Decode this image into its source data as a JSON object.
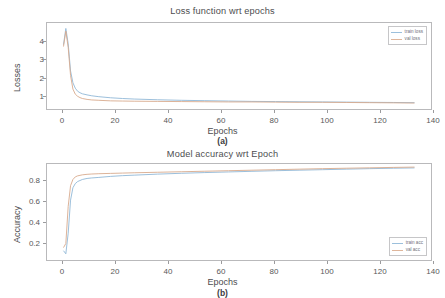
{
  "figure": {
    "panels": [
      {
        "id": "a",
        "subcaption": "(a)",
        "title": "Loss function wrt epochs",
        "xlabel": "Epochs",
        "ylabel": "Losses",
        "xticks": [
          "0",
          "20",
          "40",
          "60",
          "80",
          "100",
          "120",
          "140"
        ],
        "yticks": [
          "1",
          "2",
          "3",
          "4"
        ],
        "legend": [
          {
            "label": "train loss",
            "color": "#8fb7d6"
          },
          {
            "label": "val loss",
            "color": "#d7a98c"
          }
        ]
      },
      {
        "id": "b",
        "subcaption": "(b)",
        "title": "Model accuracy wrt Epoch",
        "xlabel": "Epochs",
        "ylabel": "Accuracy",
        "xticks": [
          "0",
          "20",
          "40",
          "60",
          "80",
          "100",
          "120",
          "140"
        ],
        "yticks": [
          "0.2",
          "0.4",
          "0.6",
          "0.8"
        ],
        "legend": [
          {
            "label": "train acc",
            "color": "#8fb7d6"
          },
          {
            "label": "val acc",
            "color": "#d7a98c"
          }
        ]
      }
    ]
  },
  "chart_data": [
    {
      "type": "line",
      "title": "Loss function wrt epochs",
      "xlabel": "Epochs",
      "ylabel": "Losses",
      "xlim": [
        -7,
        156
      ],
      "ylim": [
        0.0,
        4.75
      ],
      "xticks": [
        0,
        20,
        40,
        60,
        80,
        100,
        120,
        140
      ],
      "yticks": [
        1,
        2,
        3,
        4
      ],
      "grid": false,
      "legend_position": "upper right",
      "x": [
        0,
        1,
        2,
        3,
        4,
        5,
        6,
        7,
        8,
        10,
        12,
        15,
        20,
        25,
        30,
        40,
        50,
        60,
        70,
        80,
        90,
        100,
        110,
        120,
        130,
        140,
        149
      ],
      "series": [
        {
          "name": "train loss",
          "color": "#8fb7d6",
          "values": [
            3.55,
            4.45,
            3.6,
            2.1,
            1.45,
            1.15,
            0.98,
            0.9,
            0.84,
            0.78,
            0.73,
            0.68,
            0.62,
            0.58,
            0.55,
            0.51,
            0.48,
            0.46,
            0.44,
            0.42,
            0.41,
            0.4,
            0.39,
            0.38,
            0.37,
            0.36,
            0.35
          ]
        },
        {
          "name": "val loss",
          "color": "#d7a98c",
          "values": [
            3.45,
            4.3,
            3.4,
            1.85,
            1.1,
            0.82,
            0.7,
            0.63,
            0.58,
            0.53,
            0.5,
            0.48,
            0.45,
            0.44,
            0.43,
            0.42,
            0.41,
            0.4,
            0.39,
            0.39,
            0.38,
            0.37,
            0.37,
            0.36,
            0.35,
            0.34,
            0.33
          ]
        }
      ]
    },
    {
      "type": "line",
      "title": "Model accuracy wrt Epoch",
      "xlabel": "Epochs",
      "ylabel": "Accuracy",
      "xlim": [
        -7,
        156
      ],
      "ylim": [
        0.04,
        0.97
      ],
      "xticks": [
        0,
        20,
        40,
        60,
        80,
        100,
        120,
        140
      ],
      "yticks": [
        0.2,
        0.4,
        0.6,
        0.8
      ],
      "grid": false,
      "legend_position": "lower right",
      "x": [
        0,
        1,
        2,
        3,
        4,
        5,
        6,
        7,
        8,
        10,
        12,
        15,
        20,
        25,
        30,
        40,
        50,
        60,
        70,
        80,
        90,
        100,
        110,
        120,
        130,
        140,
        149
      ],
      "series": [
        {
          "name": "train acc",
          "color": "#8fb7d6",
          "values": [
            0.13,
            0.1,
            0.3,
            0.62,
            0.74,
            0.78,
            0.8,
            0.81,
            0.82,
            0.83,
            0.835,
            0.84,
            0.85,
            0.857,
            0.862,
            0.872,
            0.88,
            0.887,
            0.893,
            0.899,
            0.905,
            0.91,
            0.915,
            0.92,
            0.925,
            0.929,
            0.932
          ]
        },
        {
          "name": "val acc",
          "color": "#d7a98c",
          "values": [
            0.16,
            0.2,
            0.56,
            0.76,
            0.82,
            0.845,
            0.855,
            0.86,
            0.865,
            0.87,
            0.873,
            0.876,
            0.879,
            0.882,
            0.885,
            0.89,
            0.895,
            0.9,
            0.905,
            0.91,
            0.915,
            0.92,
            0.925,
            0.929,
            0.933,
            0.937,
            0.94
          ]
        }
      ]
    }
  ]
}
